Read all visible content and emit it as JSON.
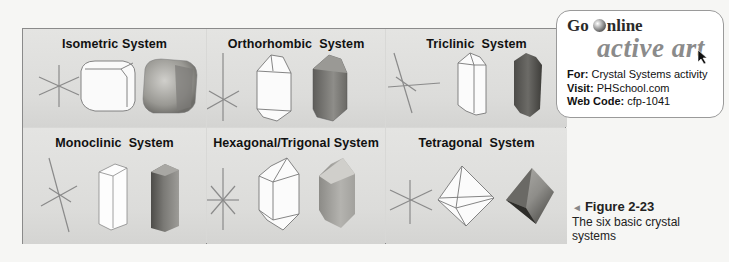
{
  "figure": {
    "panels": [
      {
        "id": "isometric",
        "title": "Isometric System"
      },
      {
        "id": "orthorhombic",
        "title": "Orthorhombic  System"
      },
      {
        "id": "triclinic",
        "title": "Triclinic  System"
      },
      {
        "id": "monoclinic",
        "title": "Monoclinic  System"
      },
      {
        "id": "hexagonal-trigonal",
        "title": "Hexagonal/Trigonal System"
      },
      {
        "id": "tetragonal",
        "title": "Tetragonal  System"
      }
    ]
  },
  "go_online": {
    "brand_prefix": "Go",
    "brand_suffix": "nline",
    "product": "active art",
    "for_label": "For:",
    "for_value": "Crystal Systems activity",
    "visit_label": "Visit:",
    "visit_value": "PHSchool.com",
    "code_label": "Web Code:",
    "code_value": "cfp-1041"
  },
  "caption": {
    "arrow": "◄",
    "figure_label": "Figure 2-23",
    "text": "The six basic crystal systems"
  }
}
